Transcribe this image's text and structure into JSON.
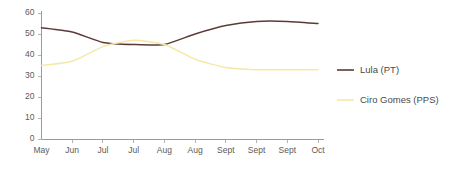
{
  "chart_data": {
    "type": "line",
    "title": "",
    "subtitle": "",
    "xlabel": "",
    "ylabel": "",
    "ylim": [
      0,
      60
    ],
    "yticks": [
      0,
      10,
      20,
      30,
      40,
      50,
      60
    ],
    "grid": false,
    "legend_position": "right",
    "categories": [
      "May",
      "Jun",
      "Jul",
      "Jul",
      "Aug",
      "Aug",
      "Sept",
      "Sept",
      "Sept",
      "Oct"
    ],
    "series": [
      {
        "name": "Lula (PT)",
        "color": "#5c3a38",
        "values": [
          53,
          51,
          46,
          45,
          45,
          50,
          54,
          56,
          56,
          55
        ]
      },
      {
        "name": "Ciro Gomes (PPS)",
        "color": "#f5e9a8",
        "values": [
          35,
          37,
          44,
          47,
          45,
          38,
          34,
          33,
          33,
          33
        ]
      }
    ]
  },
  "axis": {
    "tick_color": "#b9b4ae",
    "line_color": "#9b9b9b",
    "label_color": "#5d5a56"
  },
  "legend": {
    "entries": [
      {
        "label": "Lula (PT)",
        "color": "#5c3a38"
      },
      {
        "label": "Ciro Gomes (PPS)",
        "color": "#f5e9a8"
      }
    ]
  }
}
